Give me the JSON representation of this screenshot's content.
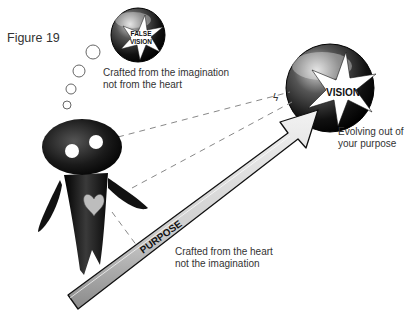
{
  "figure": {
    "title": "Figure 19"
  },
  "false_vision": {
    "badge_line1": "FALSE",
    "badge_line2": "VISION",
    "caption_line1": "Crafted from the imagination",
    "caption_line2": "not from the heart"
  },
  "vision": {
    "badge": "VISION",
    "caption_line1": "Evolving out of",
    "caption_line2": "your purpose"
  },
  "purpose": {
    "arrow_label": "PURPOSE",
    "caption_line1": "Crafted from the heart",
    "caption_line2": "not the imagination"
  },
  "colors": {
    "text": "#333333",
    "figure_dark": "#1a1a1a",
    "arrow_light": "#e6e6e6",
    "arrow_edge": "#222222",
    "heart": "#bdbdbd",
    "dash": "#888888"
  }
}
